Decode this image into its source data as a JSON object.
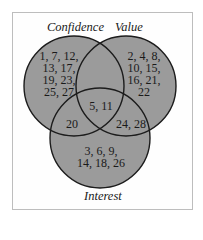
{
  "diagram": {
    "type": "venn3",
    "colors": {
      "circle_fill": "#9b9b9b",
      "circle_stroke": "#1c1c1c",
      "frame_border": "#bdbdbd",
      "text": "#1a1a1a"
    },
    "sets": [
      {
        "id": "confidence",
        "label": "Confidence"
      },
      {
        "id": "value",
        "label": "Value"
      },
      {
        "id": "interest",
        "label": "Interest"
      }
    ],
    "regions": {
      "confidence_only": "1, 7, 12,\n13, 17,\n19, 23,\n25, 27",
      "value_only": "2, 4, 8,\n10, 15,\n16, 21,\n22",
      "interest_only": "3, 6, 9,\n14, 18, 26",
      "confidence_value_interest": "5, 11",
      "confidence_interest": "20",
      "value_interest": "24, 28",
      "confidence_value": ""
    }
  }
}
